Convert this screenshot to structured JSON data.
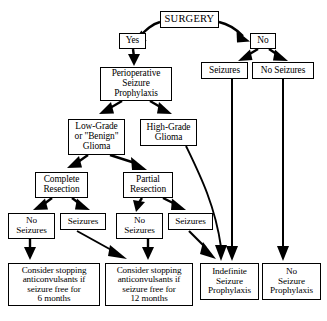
{
  "diagram": {
    "stroke_color": "#000000",
    "background_color": "#ffffff",
    "nodes": [
      {
        "id": "surgery",
        "label": "SURGERY",
        "x": 160,
        "y": 11,
        "w": 59,
        "h": 17,
        "size": "n-title"
      },
      {
        "id": "yes",
        "label": "Yes",
        "x": 119,
        "y": 33,
        "w": 27,
        "h": 16,
        "size": "n-md"
      },
      {
        "id": "no",
        "label": "No",
        "x": 250,
        "y": 33,
        "w": 26,
        "h": 16,
        "size": "n-md"
      },
      {
        "id": "seizures_top",
        "label": "Seizures",
        "x": 201,
        "y": 62,
        "w": 47,
        "h": 17,
        "size": "n-md"
      },
      {
        "id": "noseizures_top",
        "label": "No Seizures",
        "x": 252,
        "y": 62,
        "w": 62,
        "h": 17,
        "size": "n-md"
      },
      {
        "id": "periop",
        "label": "Perioperative\nSeizure\nProphylaxis",
        "x": 100,
        "y": 67,
        "w": 72,
        "h": 34,
        "size": "n-md"
      },
      {
        "id": "lowgrade",
        "label": "Low-Grade\nor \"Benign\"\nGlioma",
        "x": 68,
        "y": 119,
        "w": 57,
        "h": 36,
        "size": "n-md"
      },
      {
        "id": "highgrade",
        "label": "High-Grade\nGlioma",
        "x": 140,
        "y": 119,
        "w": 57,
        "h": 27,
        "size": "n-md"
      },
      {
        "id": "complete",
        "label": "Complete\nResection",
        "x": 35,
        "y": 172,
        "w": 53,
        "h": 26,
        "size": "n-md"
      },
      {
        "id": "partial",
        "label": "Partial\nResection",
        "x": 123,
        "y": 172,
        "w": 50,
        "h": 26,
        "size": "n-md"
      },
      {
        "id": "ns1",
        "label": "No\nSeizures",
        "x": 8,
        "y": 213,
        "w": 47,
        "h": 26,
        "size": "n-sm"
      },
      {
        "id": "sz1",
        "label": "Seizures",
        "x": 60,
        "y": 213,
        "w": 46,
        "h": 17,
        "size": "n-sm"
      },
      {
        "id": "ns2",
        "label": "No\nSeizures",
        "x": 116,
        "y": 213,
        "w": 47,
        "h": 26,
        "size": "n-sm"
      },
      {
        "id": "sz2",
        "label": "Seizures",
        "x": 168,
        "y": 213,
        "w": 45,
        "h": 17,
        "size": "n-sm"
      },
      {
        "id": "consider6",
        "label": "Consider stopping\nanticonvulsants if\nseizure free for\n6 months",
        "x": 8,
        "y": 263,
        "w": 92,
        "h": 43,
        "size": "n-body"
      },
      {
        "id": "consider12",
        "label": "Consider stopping\nanticonvulsants if\nseizure free for\n12 months",
        "x": 105,
        "y": 263,
        "w": 88,
        "h": 43,
        "size": "n-body"
      },
      {
        "id": "indefinite",
        "label": "Indefinite\nSeizure\nProphylaxis",
        "x": 200,
        "y": 263,
        "w": 59,
        "h": 37,
        "size": "n-sm"
      },
      {
        "id": "noprophylaxis",
        "label": "No\nSeizure\nProphylaxis",
        "x": 262,
        "y": 263,
        "w": 59,
        "h": 37,
        "size": "n-sm"
      }
    ],
    "edges": [
      {
        "from": "surgery",
        "to": "yes",
        "kind": "arrow"
      },
      {
        "from": "surgery",
        "to": "no",
        "kind": "arrow"
      },
      {
        "from": "yes",
        "to": "periop",
        "kind": "arrow"
      },
      {
        "from": "no",
        "to": "seizures_top",
        "kind": "arrow"
      },
      {
        "from": "no",
        "to": "noseizures_top",
        "kind": "arrow"
      },
      {
        "from": "periop",
        "to": "lowgrade",
        "kind": "arrow"
      },
      {
        "from": "periop",
        "to": "highgrade",
        "kind": "arrow"
      },
      {
        "from": "lowgrade",
        "to": "complete",
        "kind": "arrow"
      },
      {
        "from": "lowgrade",
        "to": "partial",
        "kind": "arrow"
      },
      {
        "from": "complete",
        "to": "ns1",
        "kind": "arrow"
      },
      {
        "from": "complete",
        "to": "sz1",
        "kind": "arrow"
      },
      {
        "from": "partial",
        "to": "ns2",
        "kind": "arrow"
      },
      {
        "from": "partial",
        "to": "sz2",
        "kind": "arrow"
      },
      {
        "from": "ns1",
        "to": "consider6",
        "kind": "arrow"
      },
      {
        "from": "sz1",
        "to": "consider12",
        "kind": "arrow"
      },
      {
        "from": "ns2",
        "to": "consider12",
        "kind": "arrow"
      },
      {
        "from": "sz2",
        "to": "indefinite",
        "kind": "arrow"
      },
      {
        "from": "seizures_top",
        "to": "indefinite",
        "kind": "long-vertical-arrow"
      },
      {
        "from": "noseizures_top",
        "to": "noprophylaxis",
        "kind": "long-vertical-arrow"
      },
      {
        "from": "highgrade",
        "to": "indefinite",
        "kind": "curved-arrow"
      }
    ]
  }
}
